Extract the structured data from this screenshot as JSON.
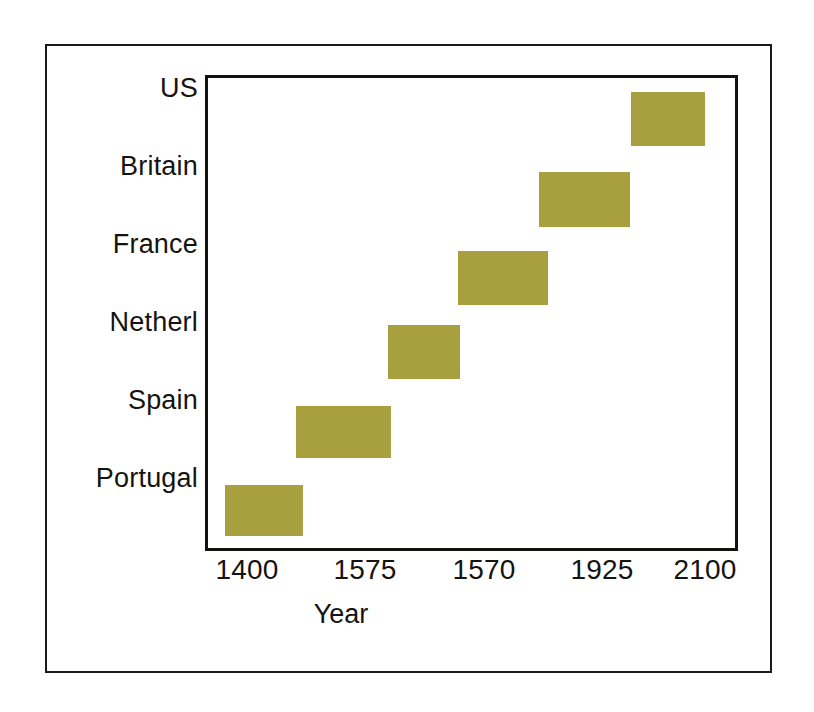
{
  "figure": {
    "background_color": "#ffffff",
    "outer_border_color": "#1c1a17",
    "plot_border_color": "#14120f",
    "bar_color": "#a8a03e",
    "text_color": "#15130f"
  },
  "axes": {
    "x_title": "Year",
    "x_tick_labels": [
      "1400",
      "1575",
      "1570",
      "1925",
      "2100"
    ],
    "y_tick_labels": [
      "US",
      "Britain",
      "France",
      "Netherl",
      "Spain",
      "Portugal"
    ]
  },
  "chart_data": {
    "type": "bar",
    "orientation": "horizontal",
    "subtype": "gantt-range",
    "title": "",
    "subtitle": "",
    "xlabel": "Year",
    "ylabel": "",
    "grid": false,
    "legend": null,
    "xlim": [
      1338,
      2100
    ],
    "x_ticks": [
      1400,
      1575,
      1570,
      1925,
      2100
    ],
    "x_tick_labels": [
      "1400",
      "1575",
      "1570",
      "1925",
      "2100"
    ],
    "categories": [
      "Portugal",
      "Spain",
      "Netherl",
      "France",
      "Britain",
      "US"
    ],
    "y_tick_labels_top_to_bottom": [
      "US",
      "Britain",
      "France",
      "Netherl",
      "Spain",
      "Portugal"
    ],
    "bars": [
      {
        "category": "Portugal",
        "start": 1425,
        "end": 1540,
        "width_years": 115
      },
      {
        "category": "Spain",
        "start": 1530,
        "end": 1670,
        "width_years": 140
      },
      {
        "category": "Netherl",
        "start": 1665,
        "end": 1770,
        "width_years": 105
      },
      {
        "category": "France",
        "start": 1768,
        "end": 1900,
        "width_years": 132
      },
      {
        "category": "Britain",
        "start": 1887,
        "end": 2021,
        "width_years": 134
      },
      {
        "category": "US",
        "start": 2022,
        "end": 2131,
        "width_years": 109
      }
    ],
    "bar_pixel_geometry": [
      {
        "category": "Portugal",
        "x": 17,
        "y": 407,
        "w": 78,
        "h": 51
      },
      {
        "category": "Spain",
        "x": 88,
        "y": 328,
        "w": 95,
        "h": 52
      },
      {
        "category": "Netherl",
        "x": 180,
        "y": 247,
        "w": 72,
        "h": 54
      },
      {
        "category": "France",
        "x": 250,
        "y": 173,
        "w": 90,
        "h": 54
      },
      {
        "category": "Britain",
        "x": 331,
        "y": 94,
        "w": 91,
        "h": 55
      },
      {
        "category": "US",
        "x": 423,
        "y": 14,
        "w": 74,
        "h": 54
      }
    ],
    "x_tick_pixel_positions": [
      247,
      365,
      484,
      602,
      705
    ],
    "y_tick_pixel_centers": [
      118,
      196,
      274,
      352,
      430,
      508
    ]
  }
}
